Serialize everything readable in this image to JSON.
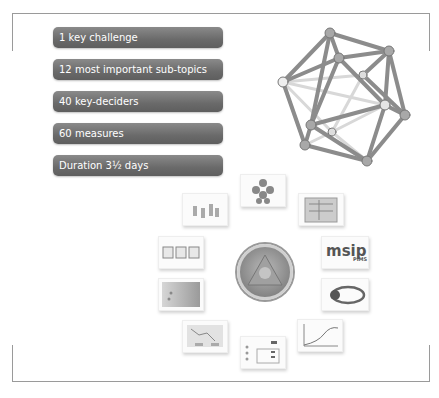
{
  "pills": [
    {
      "label": "1 key challenge"
    },
    {
      "label": "12 most important sub-topics"
    },
    {
      "label": "40 key-deciders"
    },
    {
      "label": "60 measures"
    },
    {
      "label": "Duration 3½ days"
    }
  ],
  "thumbnails": [
    {
      "name": "org-tree-thumbnail"
    },
    {
      "name": "schematic-diagram-thumbnail"
    },
    {
      "name": "msip-pims-logo-thumbnail",
      "text": "msip",
      "subtext": "PIMS"
    },
    {
      "name": "orbit-logo-thumbnail"
    },
    {
      "name": "s-curve-chart-thumbnail"
    },
    {
      "name": "checklist-table-thumbnail"
    },
    {
      "name": "flow-chart-thumbnail"
    },
    {
      "name": "map-image-thumbnail"
    },
    {
      "name": "three-panels-thumbnail"
    },
    {
      "name": "figures-illustration-thumbnail"
    }
  ],
  "colors": {
    "pill": "#6a6a6a",
    "frame": "#9a9a9a"
  }
}
